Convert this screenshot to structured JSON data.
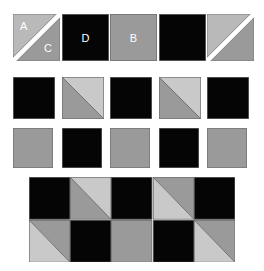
{
  "figure": {
    "title": "",
    "type": "quilt-block-piecing-diagram"
  },
  "colors": {
    "background": "#ffffff",
    "dark": "#050505",
    "gray_mid": "#9a9a9a",
    "gray_light": "#b9b9b9",
    "gray_pale": "#c9c9c9",
    "edge": "#6f6f6f",
    "seam": "#5a5a5a",
    "label_text": "#ffffff"
  },
  "labels": {
    "a": "A",
    "b": "B",
    "c": "C",
    "d": "D"
  },
  "patch_rows": [
    {
      "row_name": "row-1",
      "patches": [
        {
          "name": "patch-a-c",
          "kind": "half-square-split-gap",
          "orientation": "tl-br",
          "upper_fill": "gray_light",
          "lower_fill": "gray_mid",
          "labels": [
            {
              "text": "A",
              "pos": "tl"
            },
            {
              "text": "C",
              "pos": "br"
            }
          ]
        },
        {
          "name": "patch-d",
          "kind": "solid",
          "fill": "dark",
          "labels": [
            {
              "text": "D",
              "pos": "center"
            }
          ]
        },
        {
          "name": "patch-b",
          "kind": "solid",
          "fill": "gray_mid",
          "labels": [
            {
              "text": "B",
              "pos": "center"
            }
          ]
        },
        {
          "name": "patch-dark-1",
          "kind": "solid",
          "fill": "dark",
          "labels": []
        },
        {
          "name": "patch-split-gap-2",
          "kind": "half-square-split-gap",
          "orientation": "tl-br",
          "upper_fill": "gray_light",
          "lower_fill": "gray_mid",
          "labels": []
        }
      ]
    },
    {
      "row_name": "row-2",
      "patches": [
        {
          "name": "patch-dark-2",
          "kind": "solid",
          "fill": "dark",
          "labels": []
        },
        {
          "name": "patch-hst-1",
          "kind": "half-square-triangle",
          "orientation": "tl-br",
          "upper_fill": "gray_pale",
          "lower_fill": "gray_mid",
          "labels": []
        },
        {
          "name": "patch-dark-3",
          "kind": "solid",
          "fill": "dark",
          "labels": []
        },
        {
          "name": "patch-hst-2",
          "kind": "half-square-triangle",
          "orientation": "tl-br",
          "upper_fill": "gray_pale",
          "lower_fill": "gray_mid",
          "labels": []
        },
        {
          "name": "patch-dark-4",
          "kind": "solid",
          "fill": "dark",
          "labels": []
        }
      ]
    },
    {
      "row_name": "row-3",
      "patches": [
        {
          "name": "patch-gray-1",
          "kind": "solid",
          "fill": "gray_mid",
          "labels": []
        },
        {
          "name": "patch-dark-5",
          "kind": "solid",
          "fill": "dark",
          "labels": []
        },
        {
          "name": "patch-gray-2",
          "kind": "solid",
          "fill": "gray_mid",
          "labels": []
        },
        {
          "name": "patch-dark-6",
          "kind": "solid",
          "fill": "dark",
          "labels": []
        },
        {
          "name": "patch-gray-3",
          "kind": "solid",
          "fill": "gray_mid",
          "labels": []
        }
      ]
    }
  ],
  "assembled_block": {
    "name": "assembled-block",
    "columns": 5,
    "rows": 2,
    "cells": [
      [
        {
          "name": "cell-r1c1",
          "kind": "solid",
          "fill": "dark"
        },
        {
          "name": "cell-r1c2",
          "kind": "half-square-triangle",
          "orientation": "tl-br",
          "upper_fill": "gray_pale",
          "lower_fill": "gray_mid"
        },
        {
          "name": "cell-r1c3",
          "kind": "solid",
          "fill": "dark"
        },
        {
          "name": "cell-r1c4",
          "kind": "half-square-triangle",
          "orientation": "tl-br",
          "upper_fill": "gray_mid",
          "lower_fill": "gray_pale"
        },
        {
          "name": "cell-r1c5",
          "kind": "solid",
          "fill": "dark"
        }
      ],
      [
        {
          "name": "cell-r2c1",
          "kind": "half-square-triangle",
          "orientation": "tl-br",
          "upper_fill": "gray_mid",
          "lower_fill": "gray_pale"
        },
        {
          "name": "cell-r2c2",
          "kind": "solid",
          "fill": "dark"
        },
        {
          "name": "cell-r2c3",
          "kind": "solid",
          "fill": "gray_mid"
        },
        {
          "name": "cell-r2c4",
          "kind": "solid",
          "fill": "dark"
        },
        {
          "name": "cell-r2c5",
          "kind": "half-square-triangle",
          "orientation": "tl-br",
          "upper_fill": "gray_mid",
          "lower_fill": "gray_pale"
        }
      ]
    ]
  },
  "geometry": {
    "patch_rows_y": [
      14,
      77,
      128
    ],
    "patch_cols_x": [
      13,
      62,
      110,
      159,
      207
    ],
    "patch_size": 47,
    "patch_row2_size": 42,
    "patch_row3_size": 40,
    "assembled": {
      "x": 29,
      "y": 177,
      "width": 206,
      "height": 85
    }
  }
}
